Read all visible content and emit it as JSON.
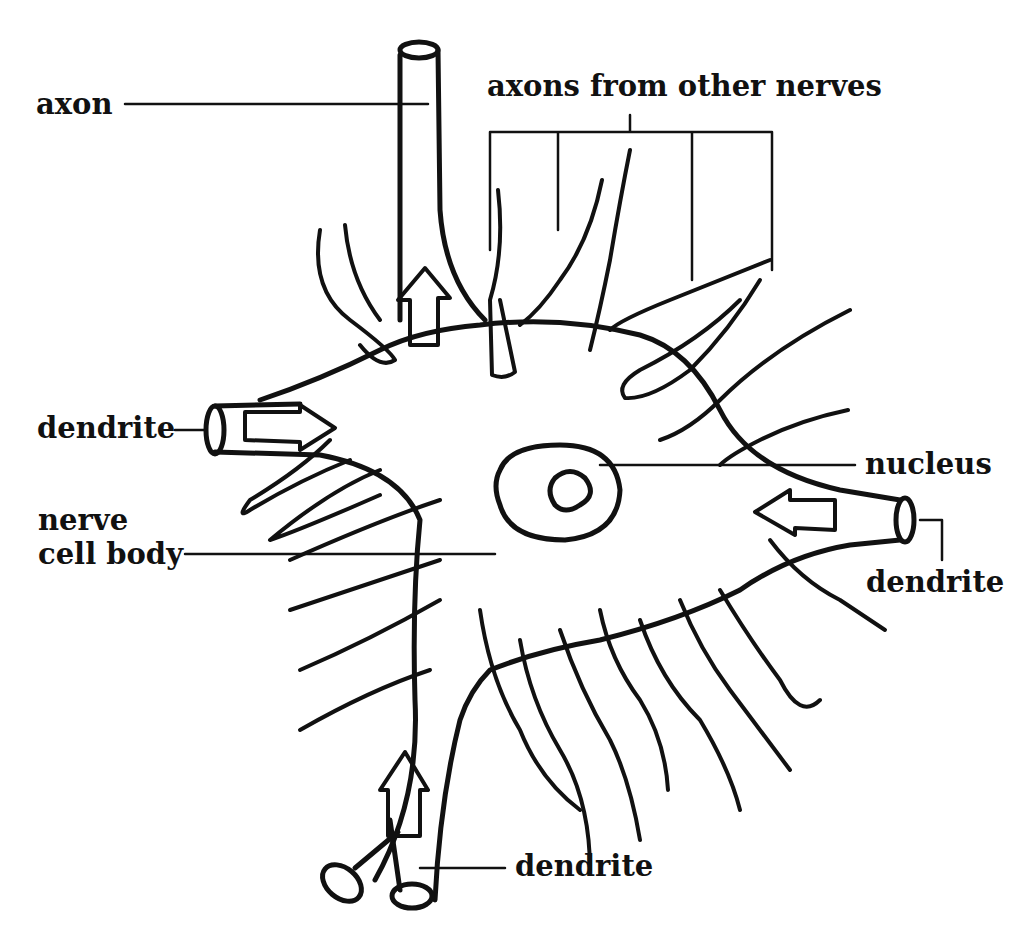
{
  "diagram": {
    "type": "neuron-labeled",
    "colors": {
      "ink": "#111111",
      "background": "#ffffff"
    },
    "labels": {
      "axon": "axon",
      "axons_from_other_nerves": "axons from other nerves",
      "dendrite_left": "dendrite",
      "nucleus": "nucleus",
      "nerve": "nerve",
      "cell_body": "cell body",
      "dendrite_right": "dendrite",
      "dendrite_bottom": "dendrite"
    }
  }
}
